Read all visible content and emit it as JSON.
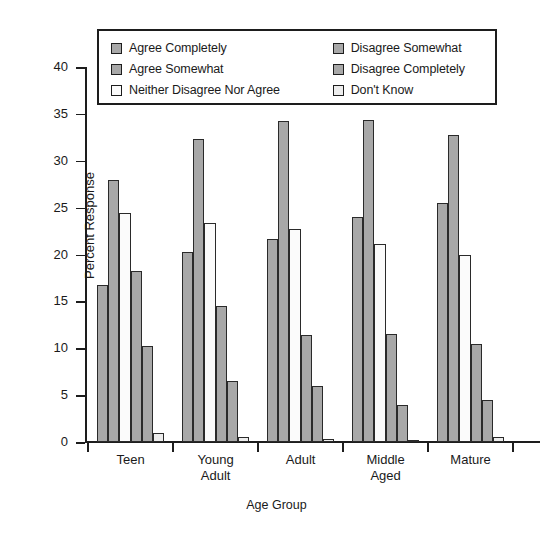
{
  "chart_data": {
    "type": "bar",
    "title": "",
    "xlabel": "Age Group",
    "ylabel": "Percent Response",
    "categories": [
      "Teen",
      "Young\nAdult",
      "Adult",
      "Middle\nAged",
      "Mature"
    ],
    "ylim": [
      0,
      40
    ],
    "yticks": [
      0,
      5,
      10,
      15,
      20,
      25,
      30,
      35,
      40
    ],
    "grid": false,
    "legend_position": "top-center-inside",
    "series": [
      {
        "name": "Agree Completely",
        "color": "#a8a8a8",
        "values": [
          16.8,
          20.3,
          21.7,
          24.0,
          25.5
        ]
      },
      {
        "name": "Agree Somewhat",
        "color": "#a8a8a8",
        "values": [
          28.0,
          32.3,
          34.2,
          34.3,
          32.7
        ]
      },
      {
        "name": "Neither Disagree Nor Agree",
        "color": "#fbfbfb",
        "values": [
          24.4,
          23.4,
          22.7,
          21.1,
          20.0
        ]
      },
      {
        "name": "Disagree Somewhat",
        "color": "#a8a8a8",
        "values": [
          18.2,
          14.5,
          11.4,
          11.5,
          10.5
        ]
      },
      {
        "name": "Disagree Completely",
        "color": "#a8a8a8",
        "values": [
          10.2,
          6.5,
          6.0,
          4.0,
          4.5
        ]
      },
      {
        "name": "Don't Know",
        "color": "#ededed",
        "values": [
          1.0,
          0.5,
          0.3,
          0.2,
          0.5
        ]
      }
    ]
  },
  "legend": {
    "left_column": [
      {
        "label": "Agree Completely",
        "swatch": "#a8a8a8"
      },
      {
        "label": "Agree Somewhat",
        "swatch": "#a8a8a8"
      },
      {
        "label": "Neither Disagree Nor Agree",
        "swatch": "#fbfbfb"
      }
    ],
    "right_column": [
      {
        "label": "Disagree Somewhat",
        "swatch": "#a8a8a8"
      },
      {
        "label": "Disagree Completely",
        "swatch": "#a8a8a8"
      },
      {
        "label": "Don't Know",
        "swatch": "#ededed"
      }
    ]
  },
  "axes": {
    "y_tick_labels": [
      "0",
      "5",
      "10",
      "15",
      "20",
      "25",
      "30",
      "35",
      "40"
    ],
    "y_axis_title": "Percent Response",
    "x_axis_title": "Age Group"
  },
  "style": {
    "bar_fill_gray": "#a8a8a8",
    "bar_fill_white": "#fbfbfb",
    "bar_fill_light": "#ededed",
    "bar_stroke": "#2a2a2a",
    "axis_color": "#1d1d1d",
    "background": "#ffffff"
  }
}
